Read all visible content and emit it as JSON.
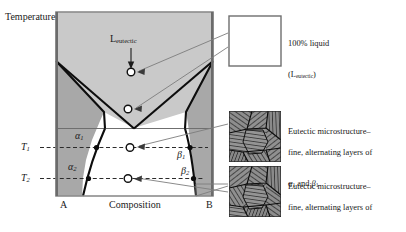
{
  "figure": {
    "type": "phase-diagram-schematic",
    "axes": {
      "y_label": "Temperature",
      "x_label": "Composition",
      "x_left_endpoint": "A",
      "x_right_endpoint": "B",
      "temperature_ticks": [
        {
          "id": "T1",
          "base": "T",
          "sub": "1"
        },
        {
          "id": "T2",
          "base": "T",
          "sub": "2"
        }
      ]
    },
    "phase_labels": [
      {
        "id": "alpha1",
        "base": "α",
        "sub": "1"
      },
      {
        "id": "alpha2",
        "base": "α",
        "sub": "2"
      },
      {
        "id": "beta1",
        "base": "β",
        "sub": "1"
      },
      {
        "id": "beta2",
        "base": "β",
        "sub": "2"
      }
    ],
    "liquid_label": {
      "base": "L",
      "sub": "eutectic"
    },
    "markers": [
      {
        "id": "point-liquid",
        "x": 131,
        "y": 72,
        "note": "100% liquid point in L field"
      },
      {
        "id": "point-eutectic",
        "x": 128,
        "y": 109,
        "note": "just above eutectic isotherm"
      },
      {
        "id": "point-T1",
        "x": 130,
        "y": 147,
        "note": "on T1 tie line"
      },
      {
        "id": "point-T2",
        "x": 128,
        "y": 178,
        "note": "on T2 tie line"
      }
    ]
  },
  "callouts": [
    {
      "id": "callout-liquid",
      "box": "empty-white",
      "line1": "100% liquid",
      "line2_base": "(L",
      "line2_sub": "eutectic",
      "line2_tail": ")"
    },
    {
      "id": "callout-eutectic-1",
      "box": "eutectic-microstructure",
      "line1": "Eutectic microstructure–",
      "line2": "fine, alternating layers of",
      "line3_a_base": "α",
      "line3_a_sub": "1",
      "line3_mid": " and ",
      "line3_b_base": "β",
      "line3_b_sub": "1",
      "line3_tail": ""
    },
    {
      "id": "callout-eutectic-2",
      "box": "eutectic-microstructure",
      "line1": "Eutectic microstructure–",
      "line2": "fine, alternating layers of",
      "line3_a_base": "α",
      "line3_a_sub": "2",
      "line3_mid": " and ",
      "line3_b_base": "β",
      "line3_b_sub": "2",
      "line3_tail": "*"
    }
  ],
  "colors": {
    "liquid_field": "#c9c9c9",
    "solid_solution_field": "#a8a8a8",
    "two_phase_field": "#ffffff",
    "frame": "#8c8c8c",
    "curve": "#0d0d0d",
    "dashed_tie_line": "#2b2b2b",
    "leader_line": "#7d7d7d",
    "text": "#171717",
    "callout_box_border": "#6e6e6e"
  }
}
